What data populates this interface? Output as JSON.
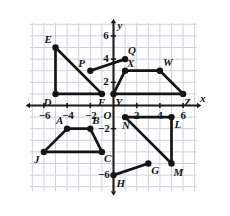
{
  "figure": {
    "background_color": "#ffffff",
    "grid_color": "#c9d2dc",
    "axis_color": "#1a1a1a",
    "shape_color": "#141414",
    "point_color": "#141414"
  },
  "axes": {
    "x_label": "x",
    "y_label": "y",
    "origin_label": "O",
    "xlim": [
      -7,
      7
    ],
    "ylim": [
      -7,
      7
    ],
    "grid": true,
    "x_ticks": [
      {
        "value": -6,
        "label": "−6"
      },
      {
        "value": -4,
        "label": "−4"
      },
      {
        "value": -2,
        "label": "−2"
      },
      {
        "value": 2,
        "label": "2"
      },
      {
        "value": 4,
        "label": "4"
      },
      {
        "value": 6,
        "label": "6"
      }
    ],
    "y_ticks": [
      {
        "value": 6,
        "label": "6"
      },
      {
        "value": 4,
        "label": "4"
      },
      {
        "value": 2,
        "label": "2"
      },
      {
        "value": -2,
        "label": "−2"
      },
      {
        "value": -6,
        "label": "−6"
      }
    ]
  },
  "points": [
    {
      "name": "E",
      "label": "E",
      "x": -5,
      "y": 5,
      "label_dx": -11,
      "label_dy": -14
    },
    {
      "name": "D",
      "label": "D",
      "x": -5,
      "y": 1,
      "label_dx": -12,
      "label_dy": 3
    },
    {
      "name": "F",
      "label": "F",
      "x": -1,
      "y": 1,
      "label_dx": -4,
      "label_dy": 3
    },
    {
      "name": "P",
      "label": "P",
      "x": -2,
      "y": 3,
      "label_dx": -12,
      "label_dy": -13
    },
    {
      "name": "Q",
      "label": "Q",
      "x": 1,
      "y": 4,
      "label_dx": 3,
      "label_dy": -14
    },
    {
      "name": "Y",
      "label": "Y",
      "x": 0,
      "y": 1,
      "label_dx": 2,
      "label_dy": 3
    },
    {
      "name": "X",
      "label": "X",
      "x": 1,
      "y": 3,
      "label_dx": 2,
      "label_dy": -13
    },
    {
      "name": "W",
      "label": "W",
      "x": 4,
      "y": 3,
      "label_dx": 3,
      "label_dy": -14
    },
    {
      "name": "Z",
      "label": "Z",
      "x": 6,
      "y": 1,
      "label_dx": 1,
      "label_dy": 3
    },
    {
      "name": "A",
      "label": "A",
      "x": -4,
      "y": -2,
      "label_dx": -11,
      "label_dy": -14
    },
    {
      "name": "B",
      "label": "B",
      "x": -2,
      "y": -2,
      "label_dx": 2,
      "label_dy": -14
    },
    {
      "name": "C",
      "label": "C",
      "x": -1,
      "y": -4,
      "label_dx": 2,
      "label_dy": 1
    },
    {
      "name": "J",
      "label": "J",
      "x": -6,
      "y": -4,
      "label_dx": -10,
      "label_dy": 2
    },
    {
      "name": "N",
      "label": "N",
      "x": 1,
      "y": -1,
      "label_dx": -3,
      "label_dy": 3
    },
    {
      "name": "L",
      "label": "L",
      "x": 5,
      "y": -1,
      "label_dx": 3,
      "label_dy": 2
    },
    {
      "name": "M",
      "label": "M",
      "x": 5,
      "y": -5,
      "label_dx": 2,
      "label_dy": 3
    },
    {
      "name": "G",
      "label": "G",
      "x": 3,
      "y": -5,
      "label_dx": 3,
      "label_dy": 1
    },
    {
      "name": "H",
      "label": "H",
      "x": 0,
      "y": -6,
      "label_dx": 3,
      "label_dy": 3
    }
  ],
  "shapes": [
    {
      "name": "triangle-EDF",
      "vertices": [
        "E",
        "D",
        "F"
      ],
      "closed": true
    },
    {
      "name": "segment-PQ",
      "vertices": [
        "P",
        "Q"
      ],
      "closed": false
    },
    {
      "name": "trapezoid-YXWZ",
      "vertices": [
        "Y",
        "X",
        "W",
        "Z"
      ],
      "closed": true
    },
    {
      "name": "trapezoid-JABC",
      "vertices": [
        "J",
        "A",
        "B",
        "C"
      ],
      "closed": true
    },
    {
      "name": "triangle-NLM",
      "vertices": [
        "N",
        "L",
        "M"
      ],
      "closed": true
    },
    {
      "name": "segment-HG",
      "vertices": [
        "H",
        "G"
      ],
      "closed": false
    }
  ]
}
